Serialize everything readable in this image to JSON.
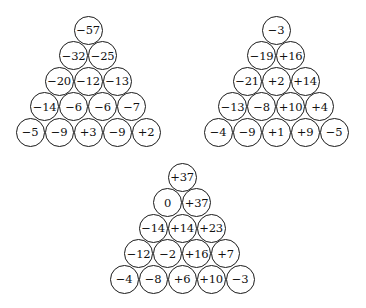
{
  "pyramids": [
    {
      "name": "pyramid-1",
      "apex": {
        "x": 88,
        "y": 30
      },
      "rows": [
        [
          "−57"
        ],
        [
          "−32",
          "−25"
        ],
        [
          "−20",
          "−12",
          "−13"
        ],
        [
          "−14",
          "−6",
          "−6",
          "−7"
        ],
        [
          "−5",
          "−9",
          "+3",
          "−9",
          "+2"
        ]
      ]
    },
    {
      "name": "pyramid-2",
      "apex": {
        "x": 276,
        "y": 30
      },
      "rows": [
        [
          "−3"
        ],
        [
          "−19",
          "+16"
        ],
        [
          "−21",
          "+2",
          "+14"
        ],
        [
          "−13",
          "−8",
          "+10",
          "+4"
        ],
        [
          "−4",
          "−9",
          "+1",
          "+9",
          "−5"
        ]
      ]
    },
    {
      "name": "pyramid-3",
      "apex": {
        "x": 182,
        "y": 177
      },
      "rows": [
        [
          "+37"
        ],
        [
          "0",
          "+37"
        ],
        [
          "−14",
          "+14",
          "+23"
        ],
        [
          "−12",
          "−2",
          "+16",
          "+7"
        ],
        [
          "−4",
          "−8",
          "+6",
          "+10",
          "−3"
        ]
      ]
    }
  ],
  "layout": {
    "cell_spacing_x": 29,
    "row_spacing_y": 25.5,
    "cell_diameter": 29
  }
}
